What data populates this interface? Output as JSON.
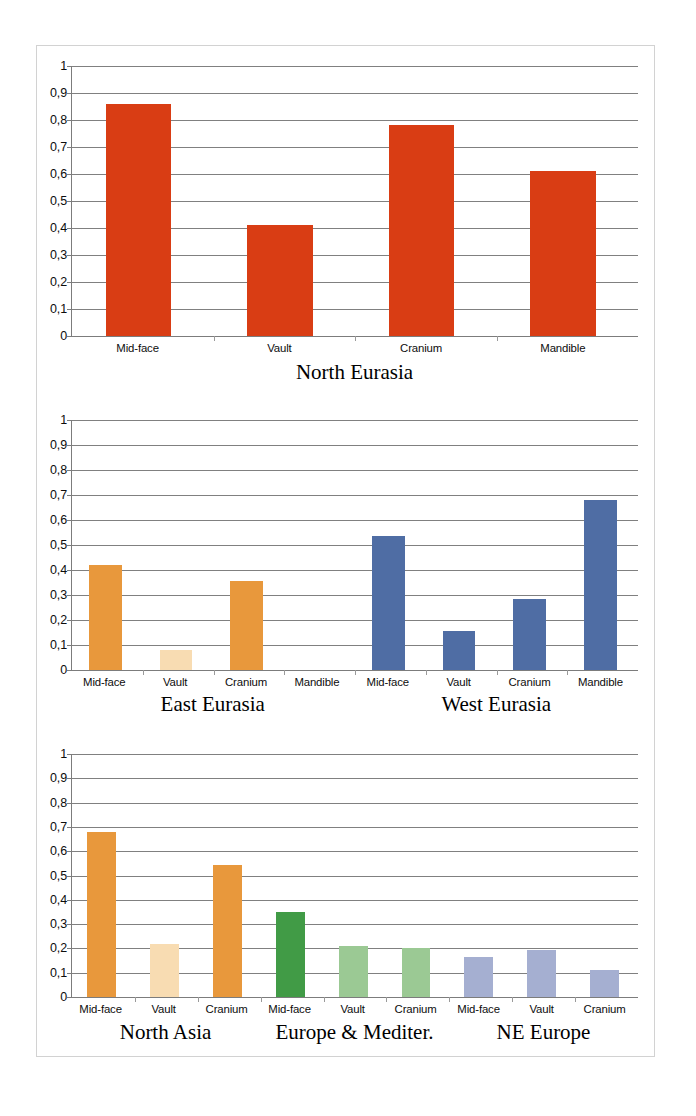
{
  "figure": {
    "background_color": "#ffffff",
    "border_color": "#d2d2d2"
  },
  "palette": {
    "red": "#D93D14",
    "orange": "#E8983C",
    "orange_light": "#F8DCB2",
    "blue": "#4F6DA4",
    "green_dark": "#419B46",
    "green_light": "#9BC994",
    "periwinkle": "#A5AFD1",
    "gridline": "#808080",
    "axis": "#7c7c7c",
    "text": "#0d0d0d"
  },
  "axis": {
    "ticks": [
      "1",
      "0,9",
      "0,8",
      "0,7",
      "0,6",
      "0,5",
      "0,4",
      "0,3",
      "0,2",
      "0,1",
      "0"
    ],
    "values": [
      1,
      0.9,
      0.8,
      0.7,
      0.6,
      0.5,
      0.4,
      0.3,
      0.2,
      0.1,
      0
    ],
    "min": 0,
    "max": 1
  },
  "chart_data": [
    {
      "type": "bar",
      "title": "North Eurasia",
      "xlabel": "",
      "ylabel": "",
      "ylim": [
        0,
        1
      ],
      "grid": true,
      "legend": "none",
      "categories": [
        "Mid-face",
        "Vault",
        "Cranium",
        "Mandible"
      ],
      "values": [
        0.86,
        0.41,
        0.78,
        0.61
      ],
      "colors": [
        "#D93D14",
        "#D93D14",
        "#D93D14",
        "#D93D14"
      ],
      "groups": [
        {
          "label": "North Eurasia",
          "start": 0,
          "end": 4,
          "color": "#D93D14"
        }
      ]
    },
    {
      "type": "bar",
      "title": "",
      "xlabel": "",
      "ylabel": "",
      "ylim": [
        0,
        1
      ],
      "grid": true,
      "legend": "none",
      "categories": [
        "Mid-face",
        "Vault",
        "Cranium",
        "Mandible",
        "Mid-face",
        "Vault",
        "Cranium",
        "Mandible"
      ],
      "values": [
        0.42,
        0.08,
        0.355,
        0.0,
        0.535,
        0.155,
        0.285,
        0.68
      ],
      "colors": [
        "#E8983C",
        "#F8DCB2",
        "#E8983C",
        "#E8983C",
        "#4F6DA4",
        "#4F6DA4",
        "#4F6DA4",
        "#4F6DA4"
      ],
      "groups": [
        {
          "label": "East Eurasia",
          "start": 0,
          "end": 4,
          "color": "#E8983C"
        },
        {
          "label": "West Eurasia",
          "start": 4,
          "end": 8,
          "color": "#4F6DA4"
        }
      ]
    },
    {
      "type": "bar",
      "title": "",
      "xlabel": "",
      "ylabel": "",
      "ylim": [
        0,
        1
      ],
      "grid": true,
      "legend": "none",
      "categories": [
        "Mid-face",
        "Vault",
        "Cranium",
        "Mid-face",
        "Vault",
        "Cranium",
        "Mid-face",
        "Vault",
        "Cranium"
      ],
      "values": [
        0.68,
        0.22,
        0.545,
        0.35,
        0.21,
        0.2,
        0.165,
        0.195,
        0.11
      ],
      "colors": [
        "#E8983C",
        "#F8DCB2",
        "#E8983C",
        "#419B46",
        "#9BC994",
        "#9BC994",
        "#A5AFD1",
        "#A5AFD1",
        "#A5AFD1"
      ],
      "groups": [
        {
          "label": "North Asia",
          "start": 0,
          "end": 3,
          "color": "#E8983C"
        },
        {
          "label": "Europe & Mediter.",
          "start": 3,
          "end": 6,
          "color": "#419B46"
        },
        {
          "label": "NE Europe",
          "start": 6,
          "end": 9,
          "color": "#A5AFD1"
        }
      ]
    }
  ]
}
